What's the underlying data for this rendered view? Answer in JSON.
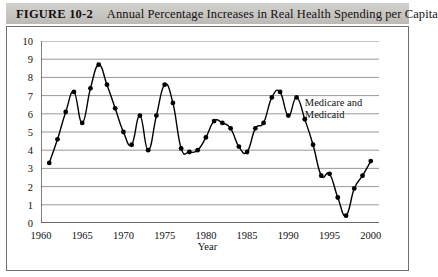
{
  "caption": {
    "figure_label": "FIGURE 10-2",
    "title": "Annual Percentage Increases in Real Health Spending per Capita"
  },
  "chart_data": {
    "type": "line",
    "title": "Annual Percentage Increases in Real Health Spending per Capita",
    "xlabel": "Year",
    "ylabel": "",
    "xlim": [
      1960,
      2001
    ],
    "ylim": [
      0,
      10
    ],
    "grid": true,
    "legend": "none",
    "xticks": [
      1960,
      1965,
      1970,
      1975,
      1980,
      1985,
      1990,
      1995,
      2000
    ],
    "yticks": [
      0,
      1,
      2,
      3,
      4,
      5,
      6,
      7,
      8,
      9,
      10
    ],
    "annotations": [
      {
        "text_line1": "Medicare and",
        "text_line2": "Medicaid",
        "x": 1992.0,
        "y": 6.6
      }
    ],
    "series": [
      {
        "name": "Real health spending per capita, annual % increase",
        "marker": "filled-circle",
        "color": "#000000",
        "x": [
          1961,
          1962,
          1963,
          1964,
          1965,
          1966,
          1967,
          1968,
          1969,
          1970,
          1971,
          1972,
          1973,
          1974,
          1975,
          1976,
          1977,
          1978,
          1979,
          1980,
          1981,
          1982,
          1983,
          1984,
          1985,
          1986,
          1987,
          1988,
          1989,
          1990,
          1991,
          1992,
          1993,
          1994,
          1995,
          1996,
          1997,
          1998,
          1999,
          2000
        ],
        "values": [
          3.3,
          4.6,
          6.1,
          7.2,
          5.5,
          7.4,
          8.7,
          7.6,
          6.3,
          5.0,
          4.3,
          5.9,
          4.0,
          5.9,
          7.6,
          6.6,
          4.1,
          3.9,
          4.0,
          4.7,
          5.6,
          5.5,
          5.2,
          4.2,
          3.9,
          5.2,
          5.5,
          6.9,
          7.2,
          5.9,
          6.9,
          5.7,
          4.3,
          2.6,
          2.7,
          1.4,
          0.4,
          1.9,
          2.6,
          3.4
        ]
      }
    ]
  }
}
